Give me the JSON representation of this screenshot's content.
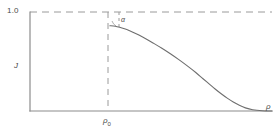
{
  "figure": {
    "title": "",
    "background_color": "#ffffff",
    "axis_color": "#8c8c8c",
    "curve_color": "#6e6e6e",
    "dashed_color": "#9a9a9a",
    "text_color": "#4a4a4a"
  },
  "labels": {
    "ytick_top": "1.0",
    "yaxis": "J",
    "xtick_rho0_symbol": "ρ",
    "xtick_rho0_subscript": "0",
    "xaxis": "ρ",
    "angle_annotation": "α"
  },
  "chart_data": {
    "type": "line",
    "title": "",
    "xlabel": "ρ",
    "ylabel": "J",
    "xlim": [
      0,
      1
    ],
    "ylim": [
      0,
      1.08
    ],
    "grid": false,
    "legend": null,
    "xticks": [
      {
        "value": 0.33,
        "label": "ρ₀"
      }
    ],
    "yticks": [
      {
        "value": 1.0,
        "label": "1.0"
      }
    ],
    "annotations": [
      {
        "text": "α",
        "kind": "angle-marker",
        "x": 0.37,
        "y": 0.97,
        "description": "initial slope angle at ρ₀"
      }
    ],
    "reference_lines": [
      {
        "orientation": "horizontal",
        "value": 1.0,
        "style": "dashed",
        "label": "1.0"
      },
      {
        "orientation": "vertical",
        "value": 0.33,
        "style": "dashed",
        "label": "ρ₀"
      }
    ],
    "series": [
      {
        "name": "J(ρ)",
        "style": "solid",
        "x": [
          0.33,
          0.345,
          0.36,
          0.38,
          0.4,
          0.425,
          0.45,
          0.48,
          0.51,
          0.545,
          0.58,
          0.615,
          0.65,
          0.685,
          0.715,
          0.74,
          0.765,
          0.79,
          0.815,
          0.84,
          0.865,
          0.89,
          0.92,
          0.96,
          1.0
        ],
        "y": [
          0.93,
          0.927,
          0.92,
          0.906,
          0.888,
          0.86,
          0.828,
          0.786,
          0.74,
          0.684,
          0.624,
          0.56,
          0.492,
          0.42,
          0.352,
          0.296,
          0.24,
          0.188,
          0.14,
          0.098,
          0.062,
          0.034,
          0.014,
          0.003,
          0.0
        ]
      }
    ]
  }
}
